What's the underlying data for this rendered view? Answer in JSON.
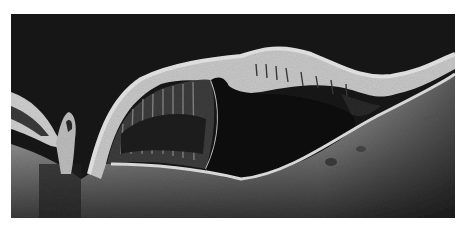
{
  "image": {
    "subject": "retinal OCT B-scan cross-section",
    "colors": {
      "background": "#ffffff",
      "vitreous": "#141414",
      "retina_bright": "#d8d8d8",
      "retina_mid": "#9a9a9a",
      "cyst_dark": "#101010",
      "choroid": "#7a7a7a"
    }
  }
}
